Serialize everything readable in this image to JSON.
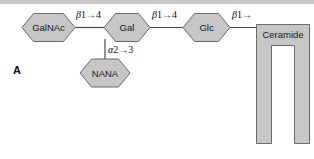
{
  "figure": {
    "panel_label": "A",
    "background_color": "#ffffff",
    "rule_color": "#c9c9c9"
  },
  "style": {
    "shape_fill": "#c6c6c6",
    "shape_stroke": "#6b6b6b",
    "line_color": "#4a4a4a",
    "text_color": "#1a1a1a"
  },
  "residues": [
    {
      "id": "galnac",
      "label": "GalNAc",
      "shape": "hexagon",
      "cx": 48.5,
      "cy": 27.5
    },
    {
      "id": "gal",
      "label": "Gal",
      "shape": "hexagon",
      "cx": 127.0,
      "cy": 27.5
    },
    {
      "id": "glc",
      "label": "Glc",
      "shape": "hexagon",
      "cx": 206.5,
      "cy": 27.5
    },
    {
      "id": "nana",
      "label": "NANA",
      "shape": "hexagon",
      "cx": 105.0,
      "cy": 73.0
    }
  ],
  "lipid": {
    "id": "ceramide",
    "label": "Ceramide",
    "shape": "inverted-u"
  },
  "linkages": [
    {
      "id": "galnac-gal",
      "greek": "β",
      "text": "1→4",
      "from": "galnac",
      "to": "gal"
    },
    {
      "id": "gal-glc",
      "greek": "β",
      "text": "1→4",
      "from": "gal",
      "to": "glc"
    },
    {
      "id": "glc-ceramide",
      "greek": "β",
      "text": "1→",
      "from": "glc",
      "to": "ceramide"
    },
    {
      "id": "gal-nana",
      "greek": "α",
      "text": "2→3",
      "from": "nana",
      "to": "gal"
    }
  ]
}
